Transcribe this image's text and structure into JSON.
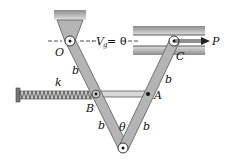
{
  "diagram": {
    "labels": {
      "O": "O",
      "C": "C",
      "B": "B",
      "A": "A",
      "P": "P",
      "k": "k",
      "theta": "θ",
      "b_upper_left": "b",
      "b_lower_left": "b",
      "b_upper_right": "b",
      "b_lower_right": "b",
      "Vg_V": "V",
      "Vg_sub": "g",
      "Vg_eq": "= 0"
    },
    "colors": {
      "bar_fill": "#b4b4b4",
      "bar_stroke": "#5a5a5a",
      "ground": "#9a9a9a",
      "line": "#222222",
      "spring": "#555555"
    }
  }
}
